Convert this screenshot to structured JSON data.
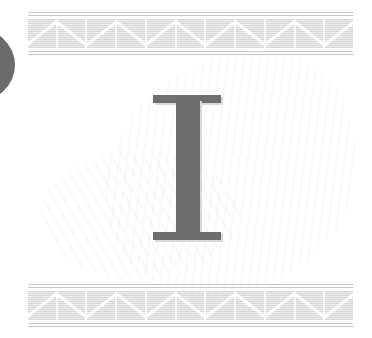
{
  "page": {
    "drop_cap": "I",
    "drop_cap_color": "#6e6e6e",
    "border_color": "#d7d7d7",
    "side_tab_color": "#6b6b6b"
  },
  "borders": {
    "top": {
      "tiles": 11
    },
    "bottom": {
      "tiles": 11
    }
  }
}
